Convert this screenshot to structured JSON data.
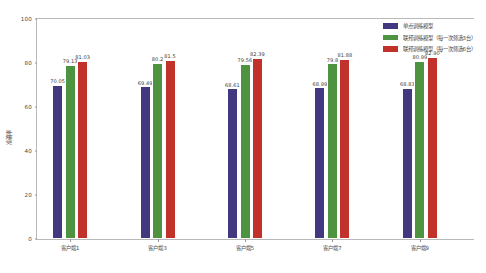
{
  "chart_data": {
    "type": "bar",
    "title": "",
    "xlabel": "",
    "ylabel": "准确率",
    "ylim": [
      0,
      100
    ],
    "yticks": [
      0,
      20,
      40,
      60,
      80,
      100
    ],
    "grid": false,
    "legend_position": "upper right",
    "categories": [
      "客户端1",
      "客户端3",
      "客户端5",
      "客户端7",
      "客户端9"
    ],
    "series": [
      {
        "name": "单点训练模型",
        "color": "#42387f",
        "values": [
          70.05,
          69.49,
          68.61,
          68.99,
          68.83
        ],
        "labels": [
          "70.05",
          "69.49",
          "68.61",
          "68.99",
          "68.83"
        ]
      },
      {
        "name": "联邦训练模型（每一次筛选3台）",
        "color": "#4d9340",
        "values": [
          79.13,
          80.2,
          79.56,
          79.8,
          80.99
        ],
        "labels": [
          "79.13",
          "80.2",
          "79.56",
          "79.8",
          "80.99"
        ]
      },
      {
        "name": "联邦训练模型（每一次筛选6台）",
        "color": "#c0322a",
        "values": [
          81.03,
          81.5,
          82.39,
          81.88,
          82.9
        ],
        "labels": [
          "81.03",
          "81.5",
          "82.39",
          "81.88",
          "82.90"
        ]
      }
    ]
  }
}
